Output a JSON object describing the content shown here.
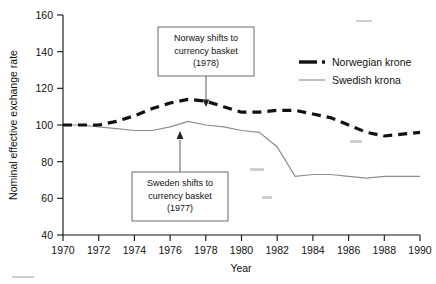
{
  "chart_data": {
    "type": "line",
    "title": "",
    "xlabel": "Year",
    "ylabel": "Nominal effective exchange rate",
    "xlim": [
      1970,
      1990
    ],
    "ylim": [
      40,
      160
    ],
    "grid": false,
    "legend_position": "top-right",
    "x": [
      1970,
      1971,
      1972,
      1973,
      1974,
      1975,
      1976,
      1977,
      1978,
      1979,
      1980,
      1981,
      1982,
      1983,
      1984,
      1985,
      1986,
      1987,
      1988,
      1989,
      1990
    ],
    "xticks": [
      "1970",
      "1972",
      "1974",
      "1976",
      "1978",
      "1980",
      "1982",
      "1984",
      "1986",
      "1988",
      "1990"
    ],
    "yticks": [
      "40",
      "60",
      "80",
      "100",
      "120",
      "140",
      "160"
    ],
    "series": [
      {
        "name": "Norwegian krone",
        "style": "thick-dashed",
        "color": "#111111",
        "values": [
          100,
          100,
          100,
          102,
          105,
          109,
          112,
          114,
          113,
          110,
          107,
          107,
          108,
          108,
          106,
          104,
          100,
          96,
          94,
          95,
          96
        ]
      },
      {
        "name": "Swedish krona",
        "style": "thin-solid",
        "color": "#8d8d8d",
        "values": [
          100,
          100,
          99,
          98,
          97,
          97,
          99,
          102,
          100,
          99,
          97,
          96,
          88,
          72,
          73,
          73,
          72,
          71,
          72,
          72,
          72
        ]
      }
    ],
    "annotations": [
      {
        "id": "norway-shift",
        "lines": [
          "Norway shifts to",
          "currency basket",
          "(1978)"
        ],
        "target_x": 1978,
        "target_y": 107
      },
      {
        "id": "sweden-shift",
        "lines": [
          "Sweden shifts to",
          "currency basket",
          "(1977)"
        ],
        "target_x": 1977,
        "target_y": 100
      }
    ]
  },
  "axes": {
    "x_label": "Year",
    "y_label": "Nominal effective exchange rate",
    "x_ticks": [
      "1970",
      "1972",
      "1974",
      "1976",
      "1978",
      "1980",
      "1982",
      "1984",
      "1986",
      "1988",
      "1990"
    ],
    "y_ticks": [
      "160",
      "140",
      "120",
      "100",
      "80",
      "60",
      "40"
    ]
  },
  "legend": {
    "entries": [
      {
        "label": "Norwegian krone"
      },
      {
        "label": "Swedish krona"
      }
    ]
  },
  "annotations": {
    "norway": {
      "line1": "Norway shifts to",
      "line2": "currency basket",
      "line3": "(1978)"
    },
    "sweden": {
      "line1": "Sweden shifts to",
      "line2": "currency basket",
      "line3": "(1977)"
    }
  }
}
